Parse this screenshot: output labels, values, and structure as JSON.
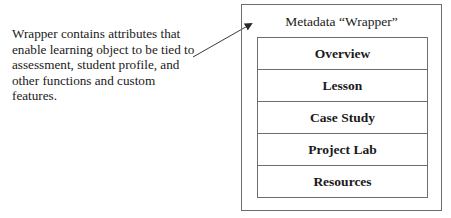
{
  "annotation": {
    "text": "Wrapper contains attributes that enable learning object to be tied to assessment, student profile, and other functions and custom features."
  },
  "wrapper": {
    "title": "Metadata “Wrapper”",
    "components": [
      {
        "label": "Overview"
      },
      {
        "label": "Lesson"
      },
      {
        "label": "Case Study"
      },
      {
        "label": "Project Lab"
      },
      {
        "label": "Resources"
      }
    ]
  },
  "arrow": {
    "icon": "arrow-pointer-icon",
    "from": [
      193,
      57
    ],
    "to": [
      253,
      23
    ]
  },
  "colors": {
    "line": "#6e6e6e",
    "text": "#1a1a1a",
    "background": "#ffffff"
  }
}
